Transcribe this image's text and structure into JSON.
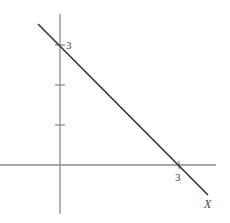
{
  "diagram": {
    "type": "line-graph",
    "axes": {
      "x_axis_label": "X",
      "y_tick_label": "3",
      "x_tick_label": "3",
      "color": "#888888"
    },
    "line": {
      "description": "Line crossing both axes at 3",
      "color": "#333333",
      "x_intercept": 3,
      "y_intercept": 3
    },
    "y_ticks": [
      1,
      2,
      3
    ]
  }
}
